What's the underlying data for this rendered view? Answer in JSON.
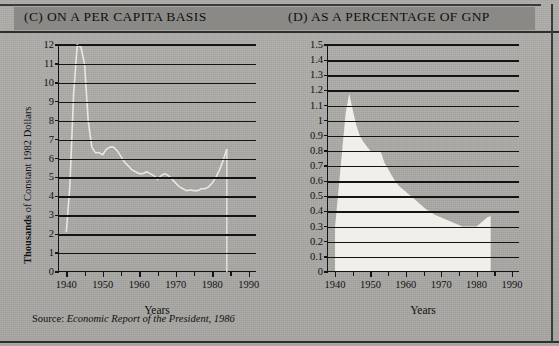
{
  "figure": {
    "panel_c_title": "(C) ON A PER CAPITA BASIS",
    "panel_d_title": "(D) AS A PERCENTAGE OF GNP",
    "source_label": "Source:",
    "source_text": "Economic Report of the President, 1986",
    "paper_color": "#a9a8a4",
    "band_color": "#8a8985",
    "ink_color": "#141414",
    "area_fill_color": "#f0efe9"
  },
  "chart_data": [
    {
      "id": "per-capita",
      "type": "line",
      "title": "(C) ON A PER CAPITA BASIS",
      "xlabel": "Years",
      "ylabel": "Thousands of Constant 1982 Dollars",
      "ylabel_bold_part": "Thousands",
      "ylabel_rest": " of Constant 1982 Dollars",
      "xlim": [
        1938,
        1992
      ],
      "ylim": [
        0,
        12
      ],
      "grid": true,
      "legend": "none",
      "ytick_labels": [
        "12",
        "11",
        "10",
        "9",
        "8",
        "7",
        "6",
        "5",
        "4",
        "3",
        "2",
        "1",
        "0"
      ],
      "ytick_values": [
        12,
        11,
        10,
        9,
        8,
        7,
        6,
        5,
        4,
        3,
        2,
        1,
        0
      ],
      "xtick_labels": [
        "1940",
        "1950",
        "1960",
        "1970",
        "1980",
        "1990"
      ],
      "xtick_values": [
        1940,
        1950,
        1960,
        1970,
        1980,
        1990
      ],
      "xtick_minor": [
        1945,
        1955,
        1965,
        1975,
        1985
      ],
      "x": [
        1940,
        1941,
        1942,
        1943,
        1944,
        1945,
        1946,
        1947,
        1948,
        1949,
        1950,
        1951,
        1952,
        1953,
        1954,
        1955,
        1956,
        1957,
        1958,
        1959,
        1960,
        1961,
        1962,
        1963,
        1964,
        1965,
        1966,
        1967,
        1968,
        1969,
        1970,
        1971,
        1972,
        1973,
        1974,
        1975,
        1976,
        1977,
        1978,
        1979,
        1980,
        1981,
        1982,
        1983,
        1984
      ],
      "y": [
        2.1,
        4.6,
        9.4,
        12.0,
        11.9,
        11.0,
        8.0,
        6.6,
        6.3,
        6.3,
        6.2,
        6.5,
        6.6,
        6.6,
        6.4,
        6.1,
        5.8,
        5.6,
        5.4,
        5.3,
        5.2,
        5.2,
        5.3,
        5.2,
        5.1,
        4.9,
        5.1,
        5.2,
        5.1,
        4.9,
        4.7,
        4.5,
        4.4,
        4.3,
        4.35,
        4.3,
        4.3,
        4.4,
        4.4,
        4.5,
        4.7,
        5.0,
        5.4,
        5.9,
        6.5
      ],
      "series_color": "#e8e7e1",
      "notes": "Faint light curve: rises steeply to a 1944 peak near 12, falls to about 6 in the late 1940s, declines to a trough near 4.3 in the mid-1970s, then rises to about 6.5 by 1984."
    },
    {
      "id": "percent-of-gnp",
      "type": "area",
      "title": "(D) AS A PERCENTAGE OF GNP",
      "xlabel": "Years",
      "ylabel": "Percent of GNP",
      "xlim": [
        1938,
        1992
      ],
      "ylim": [
        0,
        1.5
      ],
      "grid": true,
      "legend": "none",
      "ytick_labels": [
        "1.5",
        "1.4",
        "1.3",
        "1.2",
        "1.1",
        "1",
        "0.9",
        "0.8",
        "0.7",
        "0.6",
        "0.5",
        "0.4",
        "0.3",
        "0.2",
        "0.1",
        "0"
      ],
      "ytick_values": [
        1.5,
        1.4,
        1.3,
        1.2,
        1.1,
        1.0,
        0.9,
        0.8,
        0.7,
        0.6,
        0.5,
        0.4,
        0.3,
        0.2,
        0.1,
        0
      ],
      "xtick_labels": [
        "1940",
        "1950",
        "1960",
        "1970",
        "1980",
        "1990"
      ],
      "xtick_values": [
        1940,
        1950,
        1960,
        1970,
        1980,
        1990
      ],
      "xtick_minor": [
        1945,
        1955,
        1965,
        1975,
        1985
      ],
      "x": [
        1940,
        1941,
        1942,
        1943,
        1944,
        1945,
        1946,
        1947,
        1948,
        1949,
        1950,
        1951,
        1952,
        1953,
        1954,
        1955,
        1956,
        1957,
        1958,
        1959,
        1960,
        1961,
        1962,
        1963,
        1964,
        1965,
        1966,
        1967,
        1968,
        1969,
        1970,
        1971,
        1972,
        1973,
        1974,
        1975,
        1976,
        1977,
        1978,
        1979,
        1980,
        1981,
        1982,
        1983,
        1984
      ],
      "y": [
        0.3,
        0.55,
        0.8,
        1.05,
        1.18,
        1.07,
        0.97,
        0.9,
        0.86,
        0.83,
        0.8,
        0.8,
        0.8,
        0.79,
        0.72,
        0.68,
        0.64,
        0.6,
        0.57,
        0.55,
        0.53,
        0.51,
        0.49,
        0.47,
        0.45,
        0.43,
        0.41,
        0.4,
        0.38,
        0.37,
        0.36,
        0.35,
        0.34,
        0.33,
        0.32,
        0.31,
        0.3,
        0.3,
        0.3,
        0.3,
        0.3,
        0.32,
        0.34,
        0.36,
        0.37
      ],
      "fill_color": "#f0efe9",
      "notes": "Filled area peaking at about 1.18 percent of GNP in 1944, falling to roughly 0.80 through the early 1950s, 0.53 by 1960, a long decline to about 0.30 around 1976-1980, then a small rise to about 0.37 where the series ends in 1984."
    }
  ]
}
